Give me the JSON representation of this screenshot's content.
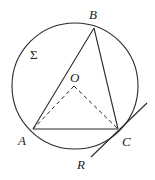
{
  "diagram": {
    "title": "",
    "colors": {
      "stroke": "#2a2a2a",
      "background": "#ffffff"
    },
    "circle": {
      "name": "Σ",
      "cx": 75,
      "cy": 86,
      "r": 63
    },
    "points": {
      "A": {
        "label": "A",
        "x": 33,
        "y": 129
      },
      "B": {
        "label": "B",
        "x": 94,
        "y": 28
      },
      "C": {
        "label": "C",
        "x": 118,
        "y": 129
      },
      "O": {
        "label": "O",
        "x": 74,
        "y": 86
      }
    },
    "tangent": {
      "label": "R",
      "from": [
        91,
        157
      ],
      "to": [
        147,
        103
      ]
    },
    "labels": {
      "A": "A",
      "B": "B",
      "C": "C",
      "O": "O",
      "R": "R",
      "sigma": "Σ"
    },
    "segments": [
      {
        "from": "A",
        "to": "B",
        "style": "solid"
      },
      {
        "from": "B",
        "to": "C",
        "style": "solid"
      },
      {
        "from": "A",
        "to": "C",
        "style": "solid"
      },
      {
        "from": "O",
        "to": "A",
        "style": "dashed"
      },
      {
        "from": "O",
        "to": "C",
        "style": "dashed"
      }
    ]
  }
}
